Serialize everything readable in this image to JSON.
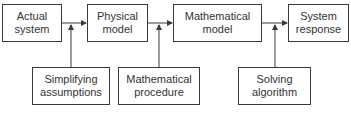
{
  "diagram": {
    "top_row": [
      {
        "id": "actual-system",
        "line1": "Actual",
        "line2": "system"
      },
      {
        "id": "physical-model",
        "line1": "Physical",
        "line2": "model"
      },
      {
        "id": "mathematical-model",
        "line1": "Mathematical",
        "line2": "model"
      },
      {
        "id": "system-response",
        "line1": "System",
        "line2": "response"
      }
    ],
    "bottom_row": [
      {
        "id": "simplifying-assumptions",
        "line1": "Simplifying",
        "line2": "assumptions"
      },
      {
        "id": "mathematical-procedure",
        "line1": "Mathematical",
        "line2": "procedure"
      },
      {
        "id": "solving-algorithm",
        "line1": "Solving",
        "line2": "algorithm"
      }
    ],
    "colors": {
      "line": "#3a3a3a",
      "text": "#333333",
      "background": "#ffffff"
    }
  }
}
